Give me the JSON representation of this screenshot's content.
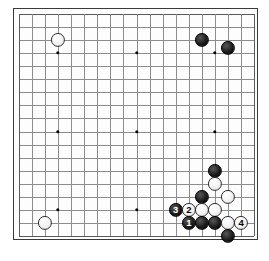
{
  "diagram": {
    "type": "go-board-diagram",
    "board_size": 19,
    "visible_columns": 19,
    "visible_rows": 18,
    "background_color": "#ffffff",
    "board_color": "#fdfdfd",
    "line_color": "#8c8c8c",
    "border_color": "#3a3a3a",
    "black_color": "#000000",
    "white_color": "#ffffff",
    "geometry": {
      "left": 17.8,
      "top": 12.8,
      "spacing": 13.08,
      "cols": 19,
      "rows": 18,
      "stone_diameter": 14.2,
      "frame_pad": 5.2
    },
    "star_points": [
      {
        "col": 3,
        "row": 3
      },
      {
        "col": 9,
        "row": 3
      },
      {
        "col": 15,
        "row": 3
      },
      {
        "col": 3,
        "row": 9
      },
      {
        "col": 9,
        "row": 9
      },
      {
        "col": 15,
        "row": 9
      },
      {
        "col": 3,
        "row": 15
      },
      {
        "col": 9,
        "row": 15
      },
      {
        "col": 15,
        "row": 15
      }
    ],
    "stones": [
      {
        "id": "w-upper-left",
        "color": "white",
        "col": 3,
        "row": 2,
        "label": ""
      },
      {
        "id": "b-upper-right-a",
        "color": "black",
        "col": 14,
        "row": 2,
        "label": ""
      },
      {
        "id": "b-upper-right-b",
        "color": "black",
        "col": 16,
        "row": 2.6,
        "label": ""
      },
      {
        "id": "w-lower-left",
        "color": "white",
        "col": 2,
        "row": 16,
        "label": ""
      },
      {
        "id": "b-right-center",
        "color": "black",
        "col": 15,
        "row": 12,
        "label": ""
      },
      {
        "id": "w-right-a",
        "color": "white",
        "col": 15,
        "row": 13,
        "label": ""
      },
      {
        "id": "b-right-b",
        "color": "black",
        "col": 14,
        "row": 14,
        "label": ""
      },
      {
        "id": "w-right-c",
        "color": "white",
        "col": 16,
        "row": 14,
        "label": ""
      },
      {
        "id": "b-move-3",
        "color": "black",
        "col": 12,
        "row": 15,
        "label": "3"
      },
      {
        "id": "w-move-2",
        "color": "white",
        "col": 13,
        "row": 15,
        "label": "2"
      },
      {
        "id": "w-cluster-a",
        "color": "white",
        "col": 14,
        "row": 15,
        "label": ""
      },
      {
        "id": "w-cluster-b",
        "color": "white",
        "col": 15,
        "row": 15,
        "label": ""
      },
      {
        "id": "b-move-1",
        "color": "black",
        "col": 13,
        "row": 16,
        "label": "1"
      },
      {
        "id": "b-cluster-c",
        "color": "black",
        "col": 14,
        "row": 16,
        "label": ""
      },
      {
        "id": "b-cluster-d",
        "color": "black",
        "col": 15,
        "row": 16,
        "label": ""
      },
      {
        "id": "w-cluster-e",
        "color": "white",
        "col": 16,
        "row": 16,
        "label": ""
      },
      {
        "id": "w-move-4",
        "color": "white",
        "col": 17,
        "row": 16,
        "label": "4"
      },
      {
        "id": "b-cluster-f",
        "color": "black",
        "col": 16,
        "row": 17,
        "label": ""
      }
    ],
    "move_labels": [
      "1",
      "2",
      "3",
      "4"
    ]
  }
}
